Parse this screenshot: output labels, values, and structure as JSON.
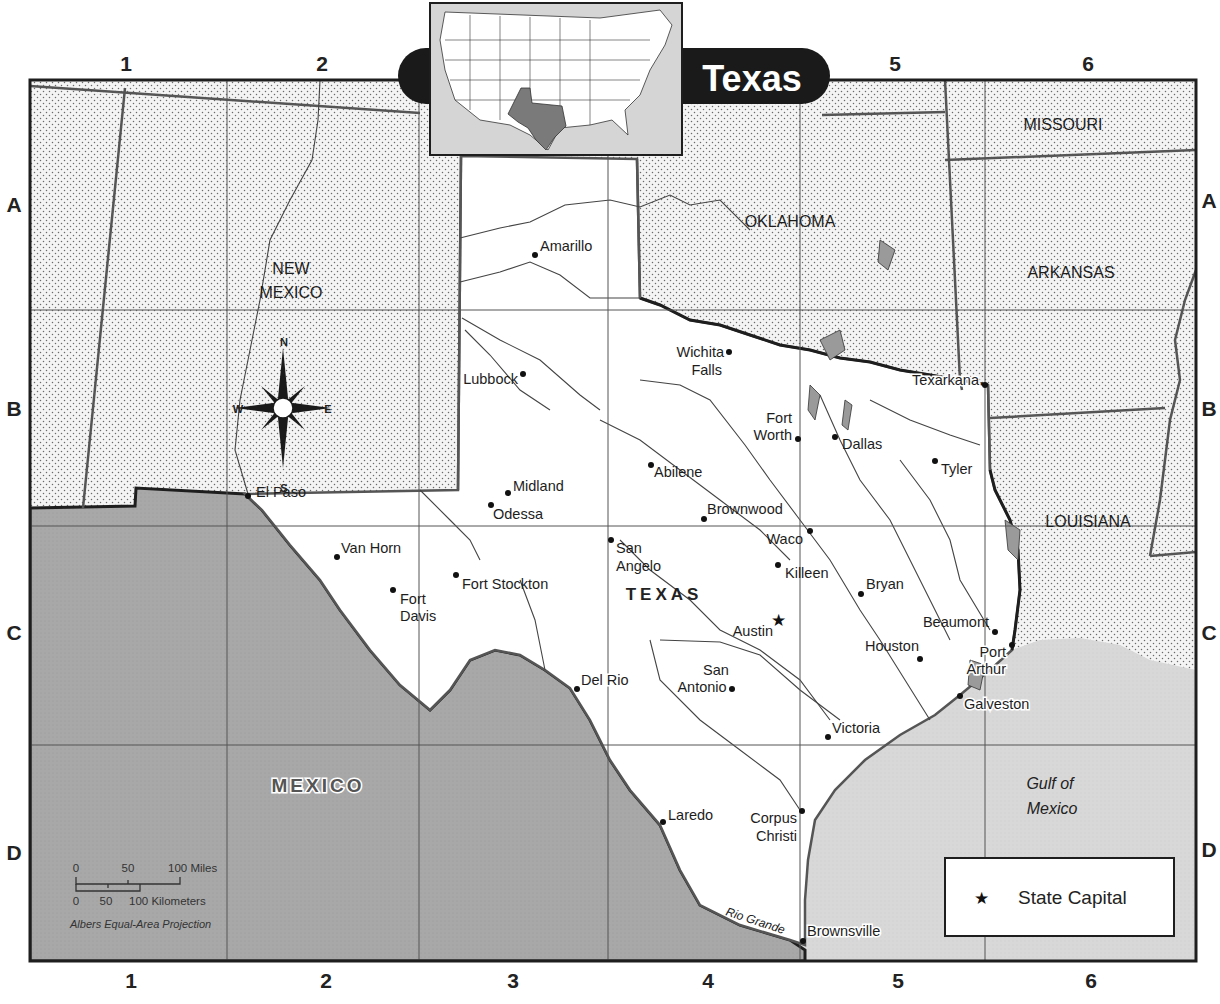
{
  "title": "Texas",
  "grid": {
    "columns": [
      "1",
      "2",
      "3",
      "4",
      "5",
      "6"
    ],
    "rows": [
      "A",
      "B",
      "C",
      "D"
    ]
  },
  "regions": {
    "main_state": "TEXAS",
    "neighbors": [
      {
        "name_line1": "NEW",
        "name_line2": "MEXICO"
      },
      {
        "name_line1": "OKLAHOMA"
      },
      {
        "name_line1": "MISSOURI"
      },
      {
        "name_line1": "ARKANSAS"
      },
      {
        "name_line1": "LOUISIANA"
      }
    ],
    "country": "MEXICO",
    "water_line1": "Gulf of",
    "water_line2": "Mexico",
    "river": "Rio Grande"
  },
  "cities": [
    {
      "name": "Amarillo"
    },
    {
      "name_line1": "Wichita",
      "name_line2": "Falls"
    },
    {
      "name": "Lubbock"
    },
    {
      "name": "Texarkana"
    },
    {
      "name_line1": "Fort",
      "name_line2": "Worth"
    },
    {
      "name": "Dallas"
    },
    {
      "name": "Tyler"
    },
    {
      "name": "Abilene"
    },
    {
      "name": "El Paso"
    },
    {
      "name": "Midland"
    },
    {
      "name": "Odessa"
    },
    {
      "name": "Brownwood"
    },
    {
      "name": "Waco"
    },
    {
      "name": "Killeen"
    },
    {
      "name_line1": "San",
      "name_line2": "Angelo"
    },
    {
      "name": "Van Horn"
    },
    {
      "name": "Fort Stockton"
    },
    {
      "name_line1": "Fort",
      "name_line2": "Davis"
    },
    {
      "name": "Bryan"
    },
    {
      "name": "Austin",
      "capital": true
    },
    {
      "name": "Beaumont"
    },
    {
      "name": "Houston"
    },
    {
      "name_line1": "Port",
      "name_line2": "Arthur"
    },
    {
      "name": "Galveston"
    },
    {
      "name": "Del Rio"
    },
    {
      "name_line1": "San",
      "name_line2": "Antonio"
    },
    {
      "name": "Victoria"
    },
    {
      "name": "Laredo"
    },
    {
      "name_line1": "Corpus",
      "name_line2": "Christi"
    },
    {
      "name": "Brownsville"
    }
  ],
  "compass": {
    "n": "N",
    "s": "S",
    "e": "E",
    "w": "W"
  },
  "scale_bar": {
    "miles_ticks": [
      "0",
      "50",
      "100 Miles"
    ],
    "km_ticks": [
      "0",
      "50",
      "100 Kilometers"
    ],
    "projection": "Albers Equal-Area Projection"
  },
  "legend": {
    "symbol": "★",
    "label": "State Capital"
  },
  "colors": {
    "land_neighbor": "#f3f3f3",
    "texas": "#ffffff",
    "mexico": "#a9a9a9",
    "water": "#d6d6d6",
    "border": "#555555",
    "title_bg": "#1a1a1a",
    "inset_texas": "#7a7a7a"
  }
}
